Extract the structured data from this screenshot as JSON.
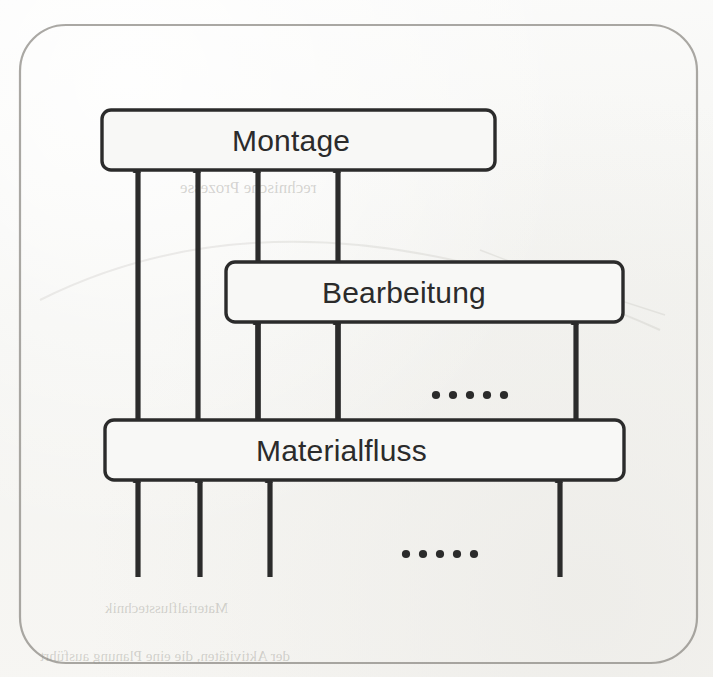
{
  "figure": {
    "type": "block-flow-diagram",
    "language": "de",
    "background_color": "#f7f6f3",
    "line_color": "#2b2b2b",
    "frame_color": "#8d8b85"
  },
  "nodes": [
    {
      "id": "montage",
      "label": "Montage",
      "x": 102,
      "y": 110,
      "width": 393,
      "height": 60,
      "label_x": 232,
      "label_y": 126
    },
    {
      "id": "bearbeitung",
      "label": "Bearbeitung",
      "x": 226,
      "y": 262,
      "width": 397,
      "height": 60,
      "label_x": 322,
      "label_y": 278
    },
    {
      "id": "materialfluss",
      "label": "Materialfluss",
      "x": 105,
      "y": 420,
      "width": 519,
      "height": 60,
      "label_x": 256,
      "label_y": 436
    }
  ],
  "arrows": [
    {
      "id": "mf-to-montage-1",
      "from": "materialfluss",
      "to": "montage",
      "x": 138,
      "y_tail": 420,
      "y_head": 172
    },
    {
      "id": "mf-to-montage-2",
      "from": "materialfluss",
      "to": "montage",
      "x": 198,
      "y_tail": 420,
      "y_head": 172
    },
    {
      "id": "mf-to-montage-3",
      "from": "materialfluss",
      "to": "montage",
      "x": 258,
      "y_tail": 420,
      "y_head": 172
    },
    {
      "id": "mf-to-montage-4",
      "from": "materialfluss",
      "to": "montage",
      "x": 338,
      "y_tail": 420,
      "y_head": 172
    },
    {
      "id": "mf-to-bearbeitung-1",
      "from": "materialfluss",
      "to": "bearbeitung",
      "x": 258,
      "y_tail": 420,
      "y_head": 324
    },
    {
      "id": "mf-to-bearbeitung-2",
      "from": "materialfluss",
      "to": "bearbeitung",
      "x": 338,
      "y_tail": 420,
      "y_head": 324
    },
    {
      "id": "mf-to-bearbeitung-3",
      "from": "materialfluss",
      "to": "bearbeitung",
      "x": 576,
      "y_tail": 420,
      "y_head": 324
    },
    {
      "id": "input-to-mf-1",
      "from": "external",
      "to": "materialfluss",
      "x": 138,
      "y_tail": 577,
      "y_head": 482
    },
    {
      "id": "input-to-mf-2",
      "from": "external",
      "to": "materialfluss",
      "x": 200,
      "y_tail": 577,
      "y_head": 482
    },
    {
      "id": "input-to-mf-3",
      "from": "external",
      "to": "materialfluss",
      "x": 270,
      "y_tail": 577,
      "y_head": 482
    },
    {
      "id": "input-to-mf-4",
      "from": "external",
      "to": "materialfluss",
      "x": 560,
      "y_tail": 577,
      "y_head": 482
    }
  ],
  "ellipses": [
    {
      "id": "ellipsis-bearbeitung-row",
      "text": "•••••",
      "dots": 5,
      "cx": 470,
      "cy": 395
    },
    {
      "id": "ellipsis-input-row",
      "text": "•••••",
      "dots": 5,
      "cx": 440,
      "cy": 554
    }
  ],
  "frame": {
    "x": 20,
    "y": 25,
    "width": 677,
    "height": 638,
    "radius": 46
  },
  "bleed_through": [
    {
      "id": "bleed-1",
      "text": "Interactions und Kommunikations",
      "x": 150,
      "y": 144,
      "size": 17
    },
    {
      "id": "bleed-2",
      "text": "rechnische Prozesse",
      "x": 180,
      "y": 178,
      "size": 17
    },
    {
      "id": "bleed-3",
      "text": "Materialflusstechnik",
      "x": 105,
      "y": 600,
      "size": 15
    },
    {
      "id": "bleed-4",
      "text": "der Aktivitäten, die eine Planung ausführt",
      "x": 40,
      "y": 648,
      "size": 15
    }
  ]
}
